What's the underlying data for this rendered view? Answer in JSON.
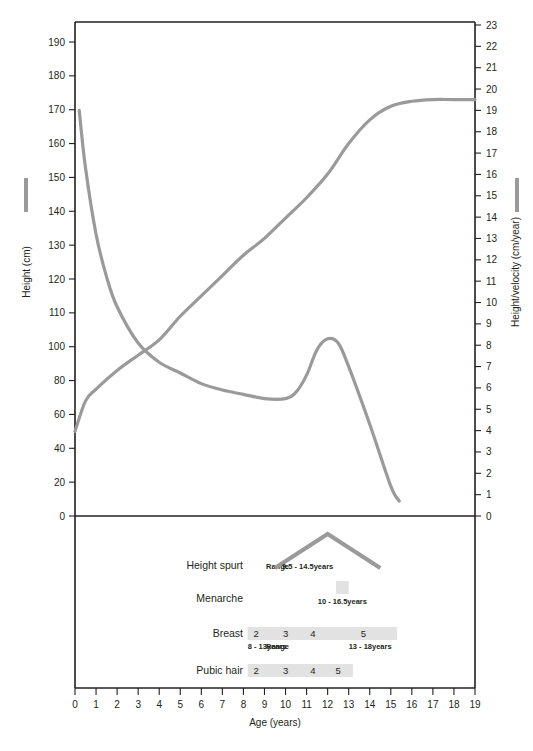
{
  "chart_data": {
    "type": "line",
    "title": "",
    "xlabel": "Age (years)",
    "ylabel_left": "Height (cm)",
    "ylabel_right": "Height/velocity (cm/year)",
    "xlim": [
      0,
      19
    ],
    "x_ticks": [
      0,
      1,
      2,
      3,
      4,
      5,
      6,
      7,
      8,
      9,
      10,
      11,
      12,
      13,
      14,
      15,
      16,
      17,
      18,
      19
    ],
    "x_ticklabels": [
      "0",
      "1",
      "2",
      "3",
      "4",
      "5",
      "6",
      "7",
      "8",
      "9",
      "10",
      "11",
      "12",
      "13",
      "14",
      "15",
      "16",
      "17",
      "18",
      "19"
    ],
    "ylim_left": [
      0,
      195
    ],
    "y_ticks_left": [
      0,
      20,
      40,
      60,
      80,
      100,
      110,
      120,
      130,
      140,
      150,
      160,
      170,
      180,
      190
    ],
    "y_ticklabels_left": [
      "0",
      "20",
      "40",
      "60",
      "80",
      "100",
      "110",
      "120",
      "130",
      "140",
      "150",
      "160",
      "170",
      "180",
      "190"
    ],
    "ylim_right": [
      0,
      23
    ],
    "y_ticks_right": [
      0,
      1,
      2,
      3,
      4,
      5,
      6,
      7,
      8,
      9,
      10,
      11,
      12,
      13,
      14,
      15,
      16,
      17,
      18,
      19,
      20,
      21,
      22,
      23
    ],
    "y_ticklabels_right": [
      "0",
      "1",
      "2",
      "3",
      "4",
      "5",
      "6",
      "7",
      "8",
      "9",
      "10",
      "11",
      "12",
      "13",
      "14",
      "15",
      "16",
      "17",
      "18",
      "19",
      "20",
      "21",
      "22",
      "23"
    ],
    "grid": false,
    "legend_position": "outside-left-and-right",
    "series": [
      {
        "name": "Height (cm)",
        "axis": "left",
        "unit": "cm",
        "color": "#9a9a9a",
        "x": [
          0,
          0.5,
          1,
          2,
          3,
          4,
          5,
          6,
          7,
          8,
          9,
          10,
          11,
          12,
          13,
          14,
          15,
          16,
          17,
          18,
          19
        ],
        "values": [
          50,
          68,
          75,
          86,
          95,
          102,
          109,
          115,
          121,
          127,
          132,
          138,
          144,
          151,
          160,
          167,
          171,
          172.5,
          173,
          173,
          173
        ]
      },
      {
        "name": "Height velocity (cm/year)",
        "axis": "right",
        "unit": "cm/year",
        "color": "#9a9a9a",
        "x": [
          0.2,
          0.5,
          1,
          1.5,
          2,
          3,
          4,
          5,
          6,
          7,
          8,
          9,
          10,
          10.5,
          11,
          11.5,
          12,
          12.5,
          13,
          14,
          15,
          15.4
        ],
        "values": [
          19,
          16.3,
          13.2,
          11.2,
          9.8,
          8.1,
          7.2,
          6.7,
          6.2,
          5.9,
          5.7,
          5.5,
          5.5,
          5.8,
          6.6,
          7.8,
          8.3,
          8.1,
          7.0,
          4.3,
          1.4,
          0.7
        ]
      }
    ],
    "puberty_stages": [
      {
        "label": "Height spurt",
        "marker_type": "peak",
        "prefix": "Range",
        "range_text": "9.5 - 14.5years",
        "range_start": 9.5,
        "range_end": 14.5,
        "peak_age": 12.0
      },
      {
        "label": "Menarche",
        "marker_type": "block",
        "prefix": "",
        "range_text": "10 - 16.5years",
        "range_start": 12.4,
        "range_end": 13.0
      },
      {
        "label": "Breast",
        "marker_type": "tanner",
        "prefix": "Tanner",
        "tanner_stages": [
          "2",
          "3",
          "4",
          "5"
        ],
        "tanner_ages": [
          8.6,
          10.0,
          11.3,
          13.7
        ],
        "band_start": 8.2,
        "band_end": 15.3,
        "sub_prefix": "Range",
        "sub_ranges": [
          {
            "text": "8 - 13years",
            "age": 8.2
          },
          {
            "text": "13 - 18years",
            "age": 13.0
          }
        ]
      },
      {
        "label": "Pubic hair",
        "marker_type": "tanner",
        "prefix": "Tanner",
        "tanner_stages": [
          "2",
          "3",
          "4",
          "5"
        ],
        "tanner_ages": [
          8.6,
          10.0,
          11.3,
          12.5
        ],
        "band_start": 8.2,
        "band_end": 13.2,
        "sub_prefix": "",
        "sub_ranges": []
      }
    ],
    "colors": {
      "curve": "#9a9a9a",
      "axis": "#231f20",
      "band": "#e2e2e2",
      "background": "#ffffff"
    }
  }
}
